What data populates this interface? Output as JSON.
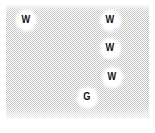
{
  "diagram": {
    "type": "particle-matrix-schematic",
    "canvas_color": "#ffffff",
    "matrix": {
      "pattern": "halftone-checker",
      "dot_color": "#c5c5c5",
      "base_color": "#ffffff"
    },
    "particle_fill": "#ffffff",
    "label_color": "#111111",
    "particles": [
      {
        "label": "W",
        "cx": 26,
        "cy": 20
      },
      {
        "label": "W",
        "cx": 110,
        "cy": 20
      },
      {
        "label": "W",
        "cx": 110,
        "cy": 48
      },
      {
        "label": "W",
        "cx": 112,
        "cy": 77
      },
      {
        "label": "G",
        "cx": 87,
        "cy": 97
      }
    ]
  }
}
